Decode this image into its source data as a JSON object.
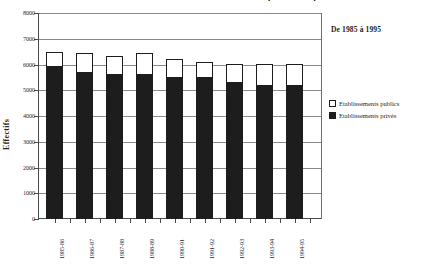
{
  "figure": {
    "title": "Evolution des effectifs des établissements publics et privés",
    "annotation": "De 1985 à 1995"
  },
  "legend": {
    "items": [
      {
        "label": "Etablissements publics",
        "color": "#ffffff",
        "swatch": "swatch-public"
      },
      {
        "label": "Etablissements privés",
        "color": "#1d1d1d",
        "swatch": "swatch-private"
      }
    ]
  },
  "chart_data": {
    "type": "bar",
    "subtype": "stacked",
    "title": "Evolution des effectifs des établissements publics et privés",
    "annotation": "De 1985 à 1995",
    "xlabel": "",
    "ylabel": "Effectifs",
    "ylim": [
      0,
      8000
    ],
    "yticks": [
      0,
      1000,
      2000,
      3000,
      4000,
      5000,
      6000,
      7000,
      8000
    ],
    "ytick_labels": [
      "0",
      "1000",
      "2000",
      "3000",
      "4000",
      "5000",
      "6000",
      "7000",
      "8000"
    ],
    "grid": true,
    "grid_axis": "y",
    "legend_position": "right",
    "categories": [
      "1985-86",
      "1986-87",
      "1987-88",
      "1988-89",
      "1990-91",
      "1991-92",
      "1992-93",
      "1993-94",
      "1994-95"
    ],
    "series": [
      {
        "name": "Etablissements privés",
        "color": "#1d1d1d",
        "values": [
          5950,
          5720,
          5630,
          5640,
          5520,
          5520,
          5330,
          5210,
          5200
        ]
      },
      {
        "name": "Etablissements publics",
        "color": "#ffffff",
        "values": [
          520,
          730,
          710,
          790,
          710,
          580,
          700,
          810,
          810
        ]
      }
    ],
    "totals": [
      6470,
      6450,
      6340,
      6430,
      6230,
      6100,
      6030,
      6020,
      6010
    ]
  }
}
